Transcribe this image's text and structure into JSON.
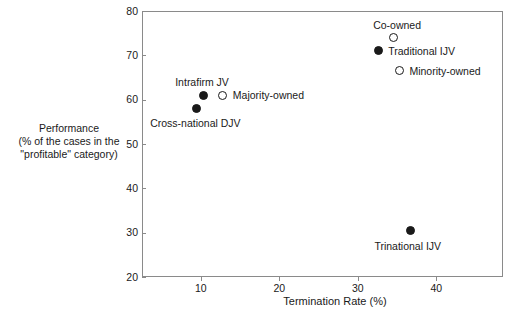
{
  "figure": {
    "clipped_title_fragment": "",
    "background_color": "#ffffff",
    "frame_color": "#8a8a8a",
    "marker_color": "#1a1a1a"
  },
  "chart_data": {
    "type": "scatter",
    "title": "",
    "xlabel": "Termination Rate (%)",
    "ylabel_lines": [
      "Performance",
      "(% of the cases in the",
      "\"profitable\" category)"
    ],
    "xlim": [
      2.5,
      48.5
    ],
    "ylim": [
      20,
      80
    ],
    "xticks": [
      10,
      20,
      30,
      40
    ],
    "xtick_labels": [
      "10",
      "20",
      "30",
      "40"
    ],
    "yticks": [
      20,
      30,
      40,
      50,
      60,
      70,
      80
    ],
    "ytick_labels": [
      "20",
      "30",
      "40",
      "50",
      "60",
      "70",
      "80"
    ],
    "grid": false,
    "legend": "none (direct point labels)",
    "points": [
      {
        "label": "Intrafirm JV",
        "x": 10.3,
        "y": 61.0,
        "marker": "filled",
        "label_position": "above-left"
      },
      {
        "label": "Majority-owned",
        "x": 12.8,
        "y": 61.0,
        "marker": "open",
        "label_position": "right"
      },
      {
        "label": "Cross-national DJV",
        "x": 9.4,
        "y": 58.0,
        "marker": "filled",
        "label_position": "below-left"
      },
      {
        "label": "Co-owned",
        "x": 34.5,
        "y": 74.0,
        "marker": "open",
        "label_position": "above"
      },
      {
        "label": "Traditional IJV",
        "x": 32.6,
        "y": 71.0,
        "marker": "filled",
        "label_position": "right"
      },
      {
        "label": "Minority-owned",
        "x": 35.3,
        "y": 66.5,
        "marker": "open",
        "label_position": "right"
      },
      {
        "label": "Trinational IJV",
        "x": 36.7,
        "y": 30.5,
        "marker": "filled",
        "label_position": "below"
      }
    ]
  }
}
